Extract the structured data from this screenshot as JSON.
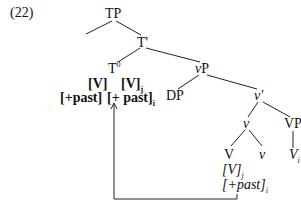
{
  "example_number": "(22)",
  "nodes": {
    "tp": "TP",
    "t_bar": "T'",
    "t0": {
      "base": "T",
      "sup": "0"
    },
    "t0_feat1": "[V]",
    "t0_feat2": {
      "base": "[V]",
      "sub": "j"
    },
    "t0_feat3": "[+past]",
    "t0_feat4": {
      "base": "[+ past]",
      "sub": "i"
    },
    "vp_small": "vP",
    "dp": "DP",
    "v_bar": "v'",
    "v_head": "v",
    "vp": "VP",
    "v_big": "V",
    "v_small": "v",
    "v_trace": {
      "base": "V",
      "sub": "i"
    },
    "v_feat1": {
      "base": "[V]",
      "sub": "j"
    },
    "v_feat2": {
      "base": "[+past]",
      "sub": "i"
    }
  }
}
